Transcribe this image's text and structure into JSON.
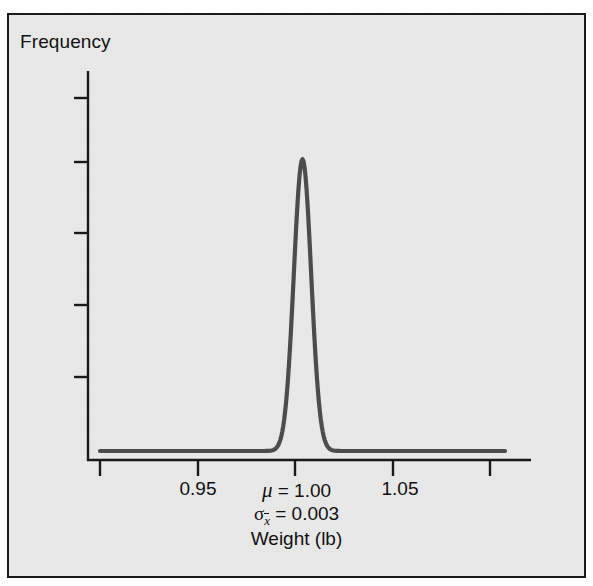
{
  "figure": {
    "background_color": "#e9e9e9",
    "border_color": "#1a1a1a",
    "curve_color": "#4c4c4c",
    "axis_color": "#1a1a1a"
  },
  "axes": {
    "y_title": "Frequency",
    "x_title": "Weight (lb)",
    "x_tick_labels": [
      "",
      "0.95",
      "",
      "1.05",
      ""
    ],
    "visible_x_tick_labels": {
      "left": "0.95",
      "right": "1.05"
    }
  },
  "annotations": {
    "mu_symbol": "μ",
    "mu_text": " = 1.00",
    "mu_full": "μ = 1.00",
    "sigma_symbol": "σ",
    "sigma_subscript": "x",
    "sigma_text": " = 0.003",
    "sigma_full": "σx̄ = 0.003"
  },
  "chart_data": {
    "type": "line",
    "title": "",
    "subtitle": "",
    "xlabel": "Weight (lb)",
    "ylabel": "Frequency",
    "xlim": [
      0.925,
      1.075
    ],
    "ylim": [
      0,
      1.1
    ],
    "grid": false,
    "legend": false,
    "x_ticks": [
      0.925,
      0.95,
      1.0,
      1.05,
      1.075
    ],
    "x_tick_labels": [
      "",
      "0.95",
      "",
      "1.05",
      ""
    ],
    "y_ticks": [
      0.0,
      0.22,
      0.44,
      0.66,
      0.88,
      1.0
    ],
    "y_tick_labels": [
      "",
      "",
      "",
      "",
      "",
      ""
    ],
    "distribution": "normal",
    "mu": 1.0,
    "sigma_xbar": 0.003,
    "peak_value": 1.0,
    "series": [
      {
        "name": "Sampling distribution of sample means",
        "x": [
          0.93,
          0.935,
          0.94,
          0.945,
          0.95,
          0.955,
          0.96,
          0.965,
          0.97,
          0.975,
          0.98,
          0.982,
          0.984,
          0.986,
          0.988,
          0.99,
          0.991,
          0.992,
          0.993,
          0.994,
          0.995,
          0.996,
          0.997,
          0.998,
          0.999,
          1.0,
          1.001,
          1.002,
          1.003,
          1.004,
          1.005,
          1.006,
          1.007,
          1.008,
          1.009,
          1.01,
          1.012,
          1.014,
          1.016,
          1.018,
          1.02,
          1.025,
          1.03,
          1.035,
          1.04,
          1.045,
          1.05,
          1.055,
          1.06,
          1.065,
          1.07
        ],
        "y": [
          0.0,
          0.0,
          0.0,
          0.0,
          0.0,
          0.0,
          0.0,
          0.0,
          0.0,
          0.001,
          0.003,
          0.007,
          0.015,
          0.029,
          0.052,
          0.087,
          0.105,
          0.135,
          0.189,
          0.264,
          0.368,
          0.487,
          0.607,
          0.756,
          0.894,
          1.0,
          0.894,
          0.756,
          0.607,
          0.487,
          0.368,
          0.264,
          0.189,
          0.135,
          0.105,
          0.087,
          0.052,
          0.029,
          0.015,
          0.007,
          0.003,
          0.001,
          0.0,
          0.0,
          0.0,
          0.0,
          0.0,
          0.0,
          0.0,
          0.0,
          0.0
        ]
      }
    ]
  }
}
